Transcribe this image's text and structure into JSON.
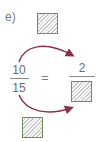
{
  "exercise": {
    "label": "e)",
    "left_fraction": {
      "numerator": "10",
      "denominator": "15"
    },
    "equals": "=",
    "right_fraction": {
      "numerator": "2",
      "denominator": ""
    },
    "blanks": {
      "top_operator": "",
      "bottom_operator": "",
      "right_denominator": ""
    }
  },
  "colors": {
    "arrow": "#8a3048",
    "box_border": "#6f8f4f",
    "hatch": "#c9c9c9",
    "text": "#6b6b6b"
  }
}
